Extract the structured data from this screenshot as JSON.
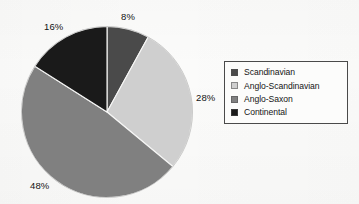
{
  "chart_data": {
    "type": "pie",
    "title": "",
    "subtitle": "",
    "xlabel": "",
    "ylabel": "",
    "legend_position": "right",
    "grid": false,
    "start_angle_deg": 0,
    "direction": "clockwise",
    "categories": [
      "Scandinavian",
      "Anglo-Scandinavian",
      "Anglo-Saxon",
      "Continental"
    ],
    "values": [
      8,
      28,
      48,
      16
    ],
    "value_unit": "%",
    "data_labels": [
      "8%",
      "28%",
      "48%",
      "16%"
    ],
    "colors": [
      "#4a4a4a",
      "#cfcfcf",
      "#808080",
      "#1a1a1a"
    ],
    "slices": [
      {
        "label": "Scandinavian",
        "value": 8,
        "display": "8%",
        "color": "#4a4a4a"
      },
      {
        "label": "Anglo-Scandinavian",
        "value": 28,
        "display": "28%",
        "color": "#cfcfcf"
      },
      {
        "label": "Anglo-Saxon",
        "value": 48,
        "display": "48%",
        "color": "#808080"
      },
      {
        "label": "Continental",
        "value": 16,
        "display": "16%",
        "color": "#1a1a1a"
      }
    ]
  },
  "legend": {
    "items": [
      {
        "label": "Scandinavian",
        "color": "#4a4a4a"
      },
      {
        "label": "Anglo-Scandinavian",
        "color": "#cfcfcf"
      },
      {
        "label": "Anglo-Saxon",
        "color": "#808080"
      },
      {
        "label": "Continental",
        "color": "#1a1a1a"
      }
    ]
  },
  "labels": {
    "scandinavian_pct": "8%",
    "anglo_scandinavian_pct": "28%",
    "anglo_saxon_pct": "48%",
    "continental_pct": "16%"
  }
}
